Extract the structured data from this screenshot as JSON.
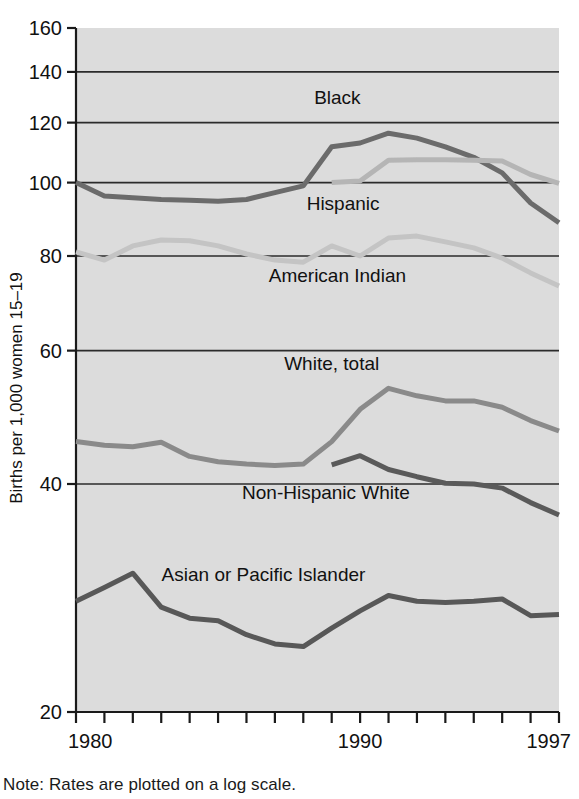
{
  "note": "Note: Rates are plotted on a log scale.",
  "chart_data": {
    "type": "line",
    "title": "",
    "xlabel": "",
    "ylabel": "Births per 1,000 women 15–19",
    "yscale": "log",
    "ylim": [
      20,
      160
    ],
    "xlim": [
      1980,
      1997
    ],
    "grid": "horizontal",
    "legend_position": "inline-labels",
    "ytick_labels": [
      "160",
      "140",
      "120",
      "100",
      "80",
      "60",
      "40",
      "20"
    ],
    "yticks": [
      160,
      140,
      120,
      100,
      80,
      60,
      40,
      20
    ],
    "xtick_labels": [
      "1980",
      "1990",
      "1997"
    ],
    "xticks": [
      1980,
      1990,
      1997
    ],
    "x": [
      1980,
      1981,
      1982,
      1983,
      1984,
      1985,
      1986,
      1987,
      1988,
      1989,
      1990,
      1991,
      1992,
      1993,
      1994,
      1995,
      1996,
      1997
    ],
    "series": [
      {
        "name": "Black",
        "color": "#6b6b6b",
        "label_x": 1989.2,
        "label_y": 127,
        "values": [
          100.0,
          96.0,
          95.5,
          95.0,
          94.8,
          94.5,
          95.0,
          97.0,
          99.0,
          111.5,
          112.8,
          116.2,
          114.5,
          111.5,
          108.0,
          103.0,
          94.0,
          88.5
        ]
      },
      {
        "name": "Hispanic",
        "color": "#b5b5b5",
        "label_x": 1989.4,
        "label_y": 92,
        "values": [
          null,
          null,
          null,
          null,
          null,
          null,
          null,
          null,
          null,
          100.0,
          100.5,
          107.0,
          107.2,
          107.2,
          107.0,
          106.8,
          102.5,
          99.8
        ]
      },
      {
        "name": "American Indian",
        "color": "#c4c4c4",
        "label_x": 1989.2,
        "label_y": 74,
        "values": [
          81.0,
          79.0,
          82.5,
          84.0,
          83.8,
          82.5,
          80.5,
          79.0,
          78.5,
          82.5,
          80.0,
          84.5,
          85.0,
          83.5,
          82.0,
          79.5,
          76.0,
          73.0
        ]
      },
      {
        "name": "White, total",
        "color": "#8a8a8a",
        "label_x": 1989.0,
        "label_y": 56.5,
        "values": [
          45.5,
          45.0,
          44.8,
          45.4,
          43.5,
          42.8,
          42.5,
          42.3,
          42.5,
          45.5,
          50.2,
          53.5,
          52.3,
          51.5,
          51.5,
          50.5,
          48.5,
          47.0
        ]
      },
      {
        "name": "Non-Hispanic White",
        "color": "#5a5a5a",
        "label_x": 1988.8,
        "label_y": 38.2,
        "values": [
          null,
          null,
          null,
          null,
          null,
          null,
          null,
          null,
          null,
          42.4,
          43.6,
          41.8,
          40.9,
          40.1,
          40.0,
          39.5,
          37.8,
          36.4
        ]
      },
      {
        "name": "Asian or Pacific Islander",
        "color": "#585858",
        "label_x": 1986.6,
        "label_y": 29.8,
        "values": [
          28.0,
          29.2,
          30.5,
          27.5,
          26.6,
          26.4,
          25.3,
          24.6,
          24.4,
          25.8,
          27.2,
          28.5,
          28.0,
          27.9,
          28.0,
          28.2,
          26.8,
          26.9
        ]
      }
    ]
  }
}
